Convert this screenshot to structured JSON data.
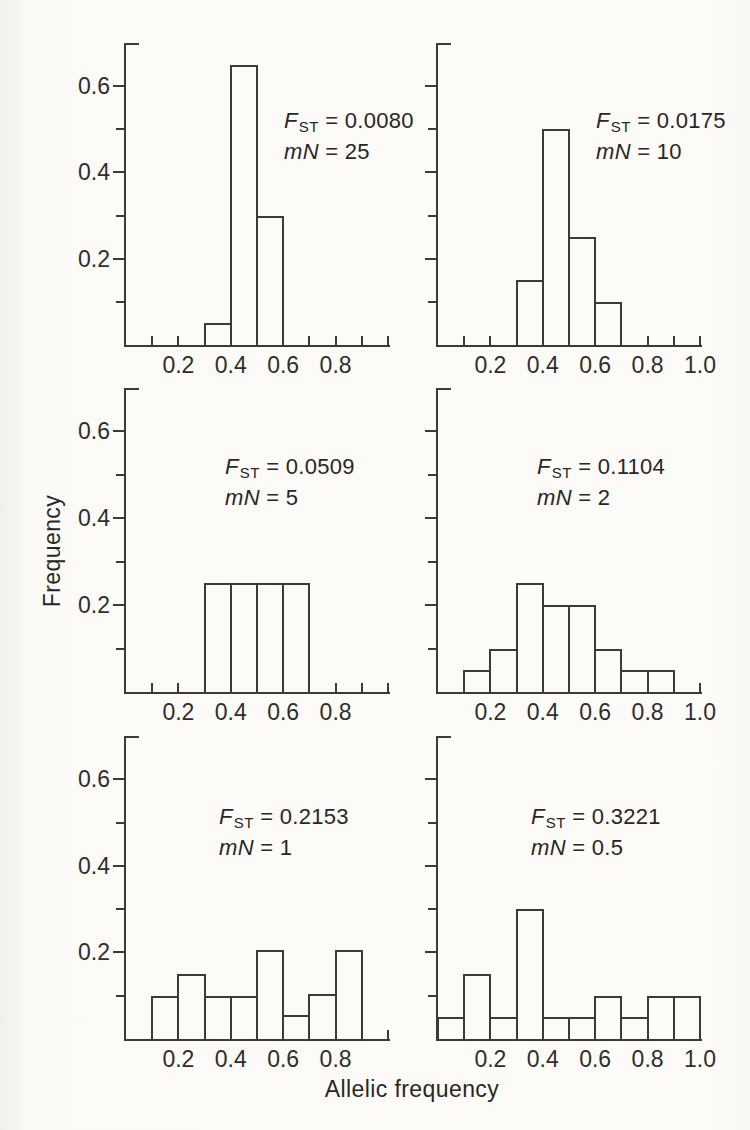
{
  "figure": {
    "y_axis_title": "Frequency",
    "x_axis_title": "Allelic frequency",
    "annotation_symbols": {
      "fst_letter": "F",
      "fst_subscript": "ST",
      "mn_letter": "mN",
      "equals": "="
    },
    "colors": {
      "line": "#3a3a3a",
      "text": "#2e2e2e",
      "background": "#fbfaf7"
    }
  },
  "chart_data": {
    "type": "bar",
    "subtype": "histogram-grid-2x3",
    "title": "",
    "xlabel": "Allelic frequency",
    "ylabel": "Frequency",
    "xlim": [
      0,
      1.0
    ],
    "ylim": [
      0,
      0.7
    ],
    "bin_width": 0.1,
    "x_tick_step": 0.1,
    "y_tick_step": 0.1,
    "y_tick_labels": [
      "0.2",
      "0.4",
      "0.6"
    ],
    "grid": false,
    "panels": [
      {
        "position": "top-left",
        "fst": "0.0080",
        "mN": "25",
        "bin_left_edges": [
          0.3,
          0.4,
          0.5
        ],
        "frequencies": [
          0.05,
          0.65,
          0.3
        ],
        "x_tick_labels": [
          "0.2",
          "0.4",
          "0.6",
          "0.8"
        ],
        "show_y_tick_labels": true
      },
      {
        "position": "top-right",
        "fst": "0.0175",
        "mN": "10",
        "bin_left_edges": [
          0.3,
          0.4,
          0.5,
          0.6
        ],
        "frequencies": [
          0.15,
          0.5,
          0.25,
          0.1
        ],
        "x_tick_labels": [
          "0.2",
          "0.4",
          "0.6",
          "0.8",
          "1.0"
        ],
        "show_y_tick_labels": false
      },
      {
        "position": "middle-left",
        "fst": "0.0509",
        "mN": "5",
        "bin_left_edges": [
          0.3,
          0.4,
          0.5,
          0.6
        ],
        "frequencies": [
          0.25,
          0.25,
          0.25,
          0.25
        ],
        "x_tick_labels": [
          "0.2",
          "0.4",
          "0.6",
          "0.8"
        ],
        "show_y_tick_labels": true
      },
      {
        "position": "middle-right",
        "fst": "0.1104",
        "mN": "2",
        "bin_left_edges": [
          0.1,
          0.2,
          0.3,
          0.4,
          0.5,
          0.6,
          0.7,
          0.8
        ],
        "frequencies": [
          0.05,
          0.1,
          0.25,
          0.2,
          0.2,
          0.1,
          0.05,
          0.05
        ],
        "x_tick_labels": [
          "0.2",
          "0.4",
          "0.6",
          "0.8",
          "1.0"
        ],
        "show_y_tick_labels": false
      },
      {
        "position": "bottom-left",
        "fst": "0.2153",
        "mN": "1",
        "bin_left_edges": [
          0.1,
          0.2,
          0.3,
          0.4,
          0.5,
          0.6,
          0.7,
          0.8
        ],
        "frequencies": [
          0.1,
          0.15,
          0.1,
          0.1,
          0.205,
          0.055,
          0.105,
          0.205
        ],
        "x_tick_labels": [
          "0.2",
          "0.4",
          "0.6",
          "0.8"
        ],
        "show_y_tick_labels": true
      },
      {
        "position": "bottom-right",
        "fst": "0.3221",
        "mN": "0.5",
        "bin_left_edges": [
          0.0,
          0.1,
          0.2,
          0.3,
          0.4,
          0.5,
          0.6,
          0.7,
          0.8,
          0.9
        ],
        "frequencies": [
          0.05,
          0.15,
          0.05,
          0.3,
          0.05,
          0.05,
          0.1,
          0.05,
          0.1,
          0.1
        ],
        "x_tick_labels": [
          "0.2",
          "0.4",
          "0.6",
          "0.8",
          "1.0"
        ],
        "show_y_tick_labels": false
      }
    ]
  }
}
